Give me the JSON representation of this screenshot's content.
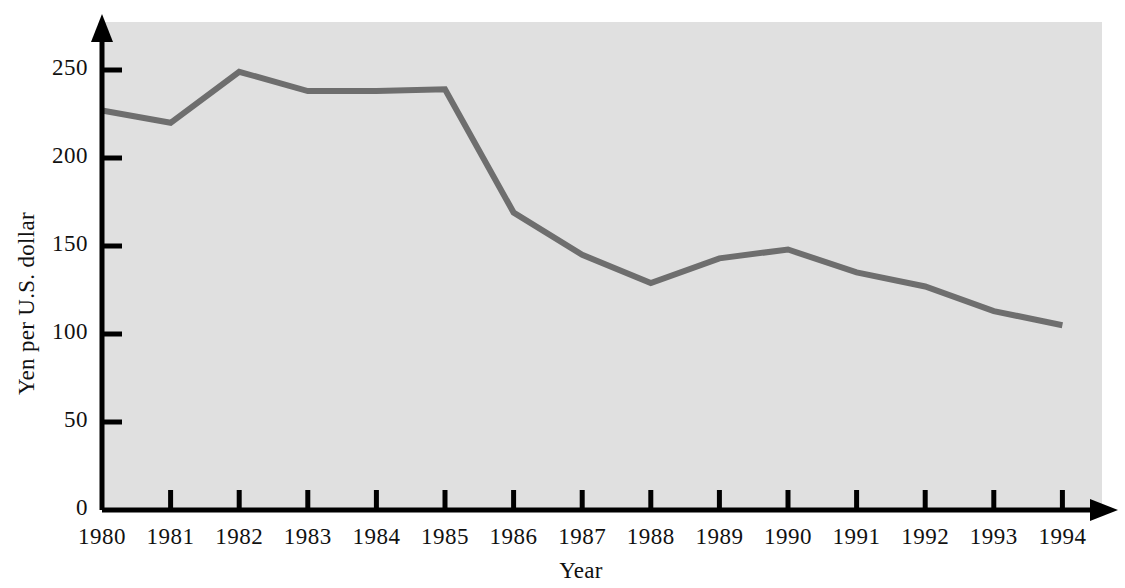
{
  "chart_data": {
    "type": "line",
    "title": "",
    "xlabel": "Year",
    "ylabel": "Yen per U.S. dollar",
    "categories": [
      "1980",
      "1981",
      "1982",
      "1983",
      "1984",
      "1985",
      "1986",
      "1987",
      "1988",
      "1989",
      "1990",
      "1991",
      "1992",
      "1993",
      "1994"
    ],
    "x": [
      1980,
      1981,
      1982,
      1983,
      1984,
      1985,
      1986,
      1987,
      1988,
      1989,
      1990,
      1991,
      1992,
      1993,
      1994
    ],
    "values": [
      227,
      220,
      249,
      238,
      238,
      239,
      169,
      145,
      129,
      143,
      148,
      135,
      127,
      113,
      105
    ],
    "series": [
      {
        "name": "Yen per U.S. dollar",
        "values": [
          227,
          220,
          249,
          238,
          238,
          239,
          169,
          145,
          129,
          143,
          148,
          135,
          127,
          113,
          105
        ]
      }
    ],
    "ylim": [
      0,
      270
    ],
    "xlim": [
      1980,
      1994
    ],
    "yticks": [
      0,
      50,
      100,
      150,
      200,
      250
    ],
    "ytick_labels": [
      "0",
      "50",
      "100",
      "150",
      "200",
      "250"
    ],
    "xtick_labels": [
      "1980",
      "1981",
      "1982",
      "1983",
      "1984",
      "1985",
      "1986",
      "1987",
      "1988",
      "1989",
      "1990",
      "1991",
      "1992",
      "1993",
      "1994"
    ],
    "grid": false,
    "legend": "none",
    "line_color": "#6e6e6e",
    "plot_background": "#e0e0e0",
    "axis_color": "#000000",
    "page_background": "#ffffff"
  },
  "axes": {
    "y_title": "Yen per U.S. dollar",
    "x_title": "Year",
    "y_ticks": [
      {
        "label": "250",
        "value": 250
      },
      {
        "label": "200",
        "value": 200
      },
      {
        "label": "150",
        "value": 150
      },
      {
        "label": "100",
        "value": 100
      },
      {
        "label": "50",
        "value": 50
      },
      {
        "label": "0",
        "value": 0
      }
    ],
    "x_ticks": [
      {
        "label": "1980"
      },
      {
        "label": "1981"
      },
      {
        "label": "1982"
      },
      {
        "label": "1983"
      },
      {
        "label": "1984"
      },
      {
        "label": "1985"
      },
      {
        "label": "1986"
      },
      {
        "label": "1987"
      },
      {
        "label": "1988"
      },
      {
        "label": "1989"
      },
      {
        "label": "1990"
      },
      {
        "label": "1991"
      },
      {
        "label": "1992"
      },
      {
        "label": "1993"
      },
      {
        "label": "1994"
      }
    ]
  }
}
